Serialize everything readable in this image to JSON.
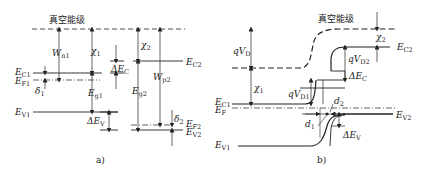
{
  "panels": [
    {
      "id": "a",
      "caption": "a)",
      "vacuum_label": "真空能级",
      "labels": {
        "EC1": {
          "main": "E",
          "sub": "C1"
        },
        "EF1": {
          "main": "E",
          "sub": "F1"
        },
        "EV1": {
          "main": "E",
          "sub": "V1"
        },
        "EC2": {
          "main": "E",
          "sub": "C2"
        },
        "EF2": {
          "main": "E",
          "sub": "F2"
        },
        "EV2": {
          "main": "E",
          "sub": "V2"
        },
        "Wn1": {
          "main": "W",
          "sub": "n1"
        },
        "chi1": {
          "main": "χ",
          "sub": "1"
        },
        "chi2": {
          "main": "χ",
          "sub": "2"
        },
        "Wp2": {
          "main": "W",
          "sub": "p2"
        },
        "Eg1": {
          "main": "E",
          "sub": "g1"
        },
        "Eg2": {
          "main": "E",
          "sub": "g2"
        },
        "dEC": {
          "main": "ΔE",
          "sub": "C"
        },
        "dEV": {
          "main": "ΔE",
          "sub": "V"
        },
        "delta1": {
          "main": "δ",
          "sub": "1"
        },
        "delta2": {
          "main": "δ",
          "sub": "2"
        }
      }
    },
    {
      "id": "b",
      "caption": "b)",
      "vacuum_label": "真空能级",
      "labels": {
        "qVD": {
          "main": "qV",
          "sub": "D"
        },
        "qVD1": {
          "main": "qV",
          "sub": "D1"
        },
        "qVD2": {
          "main": "qV",
          "sub": "D2"
        },
        "chi1": {
          "main": "χ",
          "sub": "1"
        },
        "chi2": {
          "main": "χ",
          "sub": "2"
        },
        "EC1": {
          "main": "E",
          "sub": "C1"
        },
        "EF": {
          "main": "E",
          "sub": "F"
        },
        "EV1": {
          "main": "E",
          "sub": "V1"
        },
        "EC2": {
          "main": "E",
          "sub": "C2"
        },
        "EV2": {
          "main": "E",
          "sub": "V2"
        },
        "dEC": {
          "main": "ΔE",
          "sub": "C"
        },
        "dEV": {
          "main": "ΔE",
          "sub": "V"
        },
        "d1": {
          "main": "d",
          "sub": "1"
        },
        "d2": {
          "main": "d",
          "sub": "2"
        }
      }
    }
  ],
  "colors": {
    "line": "#222222",
    "background": "#ffffff"
  }
}
